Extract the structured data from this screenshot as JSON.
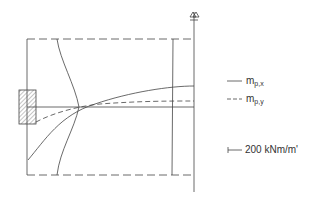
{
  "diagram": {
    "title": "",
    "legend": [
      {
        "line_style": "solid",
        "symbol": "m",
        "subscript": "p,x"
      },
      {
        "line_style": "dashed",
        "symbol": "m",
        "subscript": "p,y"
      }
    ],
    "scale_label": "200 kNm/m'",
    "section_marker": "A-A",
    "colors": {
      "line": "#444444",
      "background": "#ffffff"
    }
  }
}
